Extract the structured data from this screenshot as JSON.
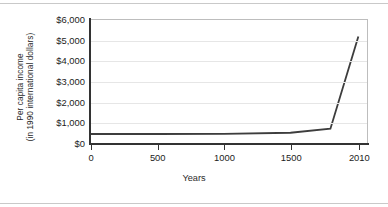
{
  "chart_data": {
    "type": "line",
    "title": "",
    "xlabel": "Years",
    "ylabel_line1": "Per capita income",
    "ylabel_line2": "(in 1990 international dollars)",
    "x": [
      0,
      500,
      1000,
      1500,
      1800,
      2010
    ],
    "values": [
      440,
      440,
      450,
      500,
      700,
      5200
    ],
    "series": [
      {
        "name": "Per capita income",
        "values": [
          440,
          440,
          450,
          500,
          700,
          5200
        ],
        "color": "#3d3d3d"
      }
    ],
    "xlim": [
      0,
      2075
    ],
    "ylim": [
      0,
      6000
    ],
    "x_tick_values": [
      0,
      500,
      1000,
      1500,
      2010
    ],
    "x_tick_labels": [
      "0",
      "500",
      "1000",
      "1500",
      "2010"
    ],
    "y_tick_values": [
      6000,
      5000,
      4000,
      3000,
      2000,
      1000,
      0
    ],
    "y_tick_labels": [
      "$6,000",
      "$5,000",
      "$4,000",
      "$3,000",
      "$2,000",
      "$1,000",
      "$0"
    ],
    "grid": "horizontal",
    "grid_color": "#e6e6e6",
    "legend": "none",
    "axis_color": "#333333",
    "plot_border_color": "#bdbdbd",
    "background": "#ffffff"
  }
}
